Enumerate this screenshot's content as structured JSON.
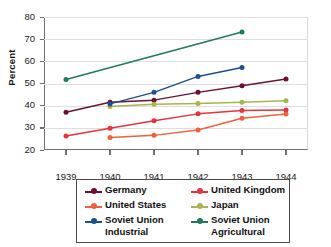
{
  "chart_data": {
    "type": "line",
    "title": "",
    "xlabel": "",
    "ylabel": "Percent",
    "categories": [
      "1939",
      "1940",
      "1941",
      "1942",
      "1943",
      "1944"
    ],
    "x": [
      1939,
      1940,
      1941,
      1942,
      1943,
      1944
    ],
    "ylim": [
      20,
      80
    ],
    "yticks": [
      20,
      30,
      40,
      50,
      60,
      70,
      80
    ],
    "grid": true,
    "legend_position": "bottom",
    "series": [
      {
        "name": "Germany",
        "color": "#6b1233",
        "values": [
          37,
          41.5,
          42.5,
          46,
          49,
          52
        ]
      },
      {
        "name": "United Kingdom",
        "color": "#e8323c",
        "values": [
          26.3,
          29.8,
          33.2,
          36.3,
          37.8,
          38
        ]
      },
      {
        "name": "United States",
        "color": "#f0603c",
        "values": [
          null,
          25.6,
          26.6,
          29,
          34.3,
          36.2
        ]
      },
      {
        "name": "Japan",
        "color": "#a9b44a",
        "values": [
          null,
          39.6,
          40.6,
          41,
          41.5,
          42.2
        ]
      },
      {
        "name": "Soviet Union Industrial",
        "color": "#1d4f91",
        "values": [
          null,
          40.8,
          46,
          53.2,
          57.2,
          null
        ]
      },
      {
        "name": "Soviet Union Agricultural",
        "color": "#207a5e",
        "values": [
          51.8,
          null,
          null,
          null,
          73.2,
          null
        ]
      }
    ]
  },
  "axis": {
    "y_tick_labels": [
      "80",
      "70",
      "60",
      "50",
      "40",
      "30",
      "20"
    ],
    "x_tick_labels": [
      "1939",
      "1940",
      "1941",
      "1942",
      "1943",
      "1944"
    ],
    "y_title": "Percent"
  },
  "legend": {
    "items": [
      {
        "label": "Germany",
        "color": "#6b1233"
      },
      {
        "label": "United Kingdom",
        "color": "#e8323c"
      },
      {
        "label": "United States",
        "color": "#f0603c"
      },
      {
        "label": "Japan",
        "color": "#a9b44a"
      },
      {
        "label": "Soviet Union\nIndustrial",
        "color": "#1d4f91"
      },
      {
        "label": "Soviet Union\nAgricultural",
        "color": "#207a5e"
      }
    ]
  }
}
